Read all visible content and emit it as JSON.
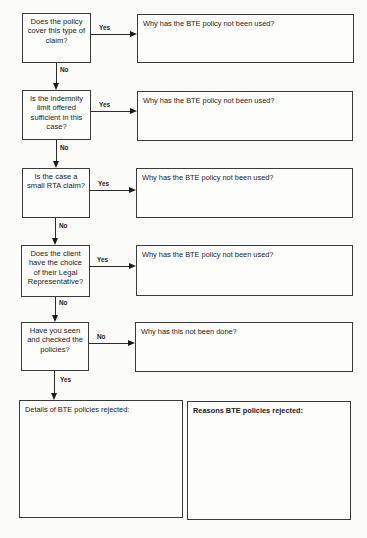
{
  "flowchart": {
    "questions": [
      {
        "text": "Does the policy cover this type of claim?",
        "branch_label": "Yes",
        "down_label": "No",
        "response_prompt": "Why has the BTE policy not been used?"
      },
      {
        "text": "Is the indemnity limit offered sufficient in this case?",
        "branch_label": "Yes",
        "down_label": "No",
        "response_prompt": "Why has the BTE policy not been used?"
      },
      {
        "text": "Is the case a small RTA claim?",
        "branch_label": "Yes",
        "down_label": "No",
        "response_prompt": "Why has the BTE policy not been used?"
      },
      {
        "text": "Does the client have the choice of their Legal Representative?",
        "branch_label": "Yes",
        "down_label": "No",
        "response_prompt": "Why has the BTE policy not been used?"
      },
      {
        "text": "Have you seen and checked the policies?",
        "branch_label": "No",
        "down_label": "Yes",
        "response_prompt": "Why has this not been done?"
      }
    ],
    "final_boxes": {
      "details_label": "Details of BTE policies rejected:",
      "reasons_label": "Reasons BTE policies rejected:"
    }
  }
}
